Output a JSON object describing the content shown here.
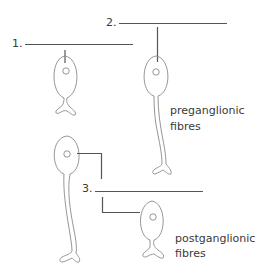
{
  "diagram": {
    "blanks": [
      {
        "number": "1.",
        "answer": ""
      },
      {
        "number": "2.",
        "answer": ""
      },
      {
        "number": "3.",
        "answer": ""
      }
    ],
    "labels": {
      "preganglionic_line1": "preganglionic",
      "preganglionic_line2": "fibres",
      "postganglionic_line1": "postganglionic",
      "postganglionic_line2": "fibres"
    },
    "colors": {
      "line": "#555555",
      "outline": "#8a8a8a",
      "text": "#3a3a3a"
    }
  }
}
